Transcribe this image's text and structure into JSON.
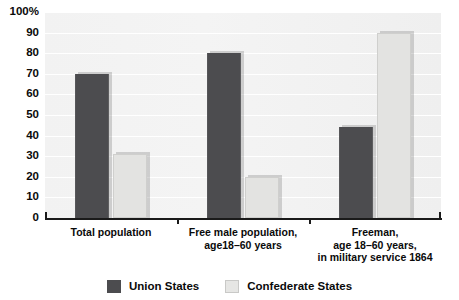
{
  "chart_data": {
    "type": "bar",
    "title": "",
    "xlabel": "",
    "ylabel": "",
    "ylim": [
      0,
      100
    ],
    "grid": true,
    "legend_position": "bottom",
    "categories": [
      [
        "Total population"
      ],
      [
        "Free male population,",
        "age18–60 years"
      ],
      [
        "Freeman,",
        "age 18–60 years,",
        "in military service 1864"
      ]
    ],
    "category_labels": [
      "Total population",
      "Free male population, age18–60 years",
      "Freeman, age 18–60 years, in military service 1864"
    ],
    "yticks": [
      "100%",
      "90",
      "80",
      "70",
      "60",
      "50",
      "40",
      "30",
      "20",
      "10",
      "0"
    ],
    "ytick_values": [
      100,
      90,
      80,
      70,
      60,
      50,
      40,
      30,
      20,
      10,
      0
    ],
    "series": [
      {
        "name": "Union States",
        "color": "#4c4c4f",
        "values": [
          70,
          80,
          44
        ]
      },
      {
        "name": "Confederate States",
        "color": "#e3e3e1",
        "values": [
          31,
          20,
          90
        ]
      }
    ]
  },
  "legend": {
    "items": [
      {
        "label": "Union States",
        "color": "#4c4c4f"
      },
      {
        "label": "Confederate States",
        "color": "#e6e6e4"
      }
    ]
  },
  "colors": {
    "union": "#4c4c4f",
    "confederate": "#e3e3e1",
    "plot_background": "#f2f2f2",
    "gridline": "#ffffff",
    "axis": "#1a1a1a",
    "text": "#0a0a0a"
  }
}
